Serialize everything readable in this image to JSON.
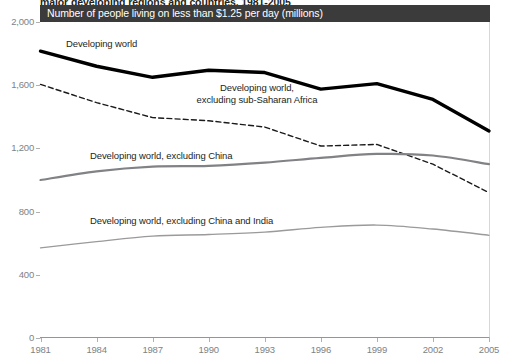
{
  "figure": {
    "title": "major developing regions and countries, 1981-2005",
    "subtitle": "Number of people living on less than $1.25 per day (millions)"
  },
  "axes": {
    "y_ticks": [
      "0",
      "400",
      "800",
      "1,200",
      "1,600",
      "2,000"
    ],
    "x_ticks": [
      "1981",
      "1984",
      "1987",
      "1990",
      "1993",
      "1996",
      "1999",
      "2002",
      "2005"
    ]
  },
  "labels": {
    "developing_world": "Developing world",
    "excl_ssa_line1": "Developing world,",
    "excl_ssa_line2": "excluding sub-Saharan Africa",
    "excl_china": "Developing world, excluding China",
    "excl_china_india": "Developing world, excluding China and India"
  },
  "colors": {
    "band": "#3b3b3b",
    "developing_world": "#000000",
    "excl_ssa": "#1a1a1a",
    "excl_china": "#808285",
    "excl_china_india": "#9a9a9a",
    "axis": "#d7d7d7",
    "tick_text": "#808285"
  },
  "chart_data": {
    "type": "line",
    "title": "major developing regions and countries, 1981-2005",
    "subtitle": "Number of people living on less than $1.25 per day (millions)",
    "xlabel": "",
    "ylabel": "Number of people living on less than $1.25 per day (millions)",
    "x": [
      1981,
      1984,
      1987,
      1990,
      1993,
      1996,
      1999,
      2002,
      2005
    ],
    "xlim": [
      1981,
      2005
    ],
    "ylim": [
      0,
      2000
    ],
    "yticks": [
      0,
      400,
      800,
      1200,
      1600,
      2000
    ],
    "grid": false,
    "legend": "inline-annotations",
    "series": [
      {
        "name": "Developing world",
        "values": [
          1815,
          1720,
          1650,
          1695,
          1680,
          1575,
          1610,
          1510,
          1310
        ],
        "style": "solid",
        "width": 3.4,
        "color": "#000000"
      },
      {
        "name": "Developing world, excluding sub-Saharan Africa",
        "values": [
          1605,
          1490,
          1395,
          1375,
          1335,
          1215,
          1225,
          1100,
          920
        ],
        "style": "dashed",
        "width": 1.4,
        "color": "#1a1a1a"
      },
      {
        "name": "Developing world, excluding China",
        "values": [
          1000,
          1055,
          1085,
          1090,
          1110,
          1140,
          1165,
          1155,
          1100
        ],
        "style": "solid",
        "width": 2.2,
        "color": "#808285"
      },
      {
        "name": "Developing world, excluding China and India",
        "values": [
          570,
          610,
          645,
          655,
          670,
          700,
          715,
          690,
          650
        ],
        "style": "solid",
        "width": 1.3,
        "color": "#9a9a9a"
      }
    ]
  }
}
